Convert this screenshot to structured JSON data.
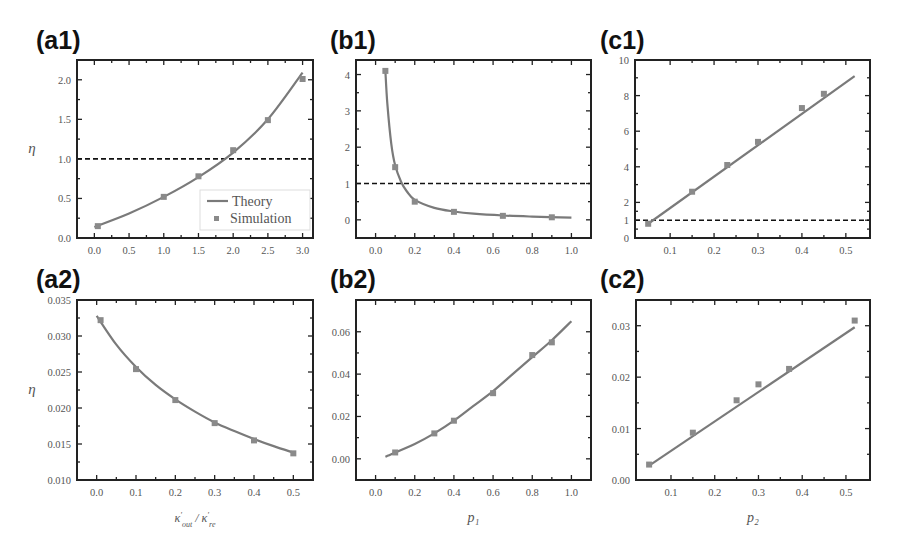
{
  "panels": [
    {
      "id": "a1",
      "label": "(a1)",
      "ylabel": "η",
      "xlabel": ""
    },
    {
      "id": "b1",
      "label": "(b1)",
      "ylabel": "",
      "xlabel": ""
    },
    {
      "id": "c1",
      "label": "(c1)",
      "ylabel": "",
      "xlabel": ""
    },
    {
      "id": "a2",
      "label": "(a2)",
      "ylabel": "η",
      "xlabel": "κ'_{out} / κ'_{re}"
    },
    {
      "id": "b2",
      "label": "(b2)",
      "ylabel": "",
      "xlabel": "p₁"
    },
    {
      "id": "c2",
      "label": "(c2)",
      "ylabel": "",
      "xlabel": "p₂"
    }
  ],
  "legend": {
    "theory": "Theory",
    "simulation": "Simulation"
  },
  "colors": {
    "curve": "#7a7a7a",
    "marker": "#8a8a8a",
    "frame": "#222222",
    "dashed": "#111111"
  },
  "chart_data": [
    {
      "id": "a1",
      "type": "line",
      "title": "(a1)",
      "xlabel": "",
      "ylabel": "η",
      "xlim": [
        -0.25,
        3.15
      ],
      "ylim": [
        0.0,
        2.25
      ],
      "xticks": [
        "0.0",
        "0.5",
        "1.0",
        "1.5",
        "2.0",
        "2.5",
        "3.0"
      ],
      "yticks": [
        "0.0",
        "0.5",
        "1.0",
        "1.5",
        "2.0"
      ],
      "reference_line": {
        "y": 1.0,
        "style": "dashed"
      },
      "legend": [
        "Theory",
        "Simulation"
      ],
      "legend_position": "lower right",
      "series": [
        {
          "name": "Theory",
          "kind": "line",
          "x": [
            0.0,
            0.5,
            1.0,
            1.5,
            2.0,
            2.5,
            3.0
          ],
          "y": [
            0.14,
            0.31,
            0.52,
            0.77,
            1.08,
            1.5,
            2.09
          ]
        },
        {
          "name": "Simulation",
          "kind": "scatter",
          "x": [
            0.05,
            1.0,
            1.5,
            2.0,
            2.5,
            3.0
          ],
          "y": [
            0.15,
            0.52,
            0.78,
            1.11,
            1.49,
            2.01
          ]
        }
      ]
    },
    {
      "id": "b1",
      "type": "line",
      "title": "(b1)",
      "xlabel": "",
      "ylabel": "",
      "xlim": [
        -0.1,
        1.1
      ],
      "ylim": [
        -0.5,
        4.4
      ],
      "xticks": [
        "0.0",
        "0.2",
        "0.4",
        "0.6",
        "0.8",
        "1.0"
      ],
      "yticks": [
        "0",
        "1",
        "2",
        "3",
        "4"
      ],
      "reference_line": {
        "y": 1.0,
        "style": "dashed"
      },
      "series": [
        {
          "name": "Theory",
          "kind": "line",
          "x": [
            0.05,
            0.06,
            0.08,
            0.1,
            0.13,
            0.16,
            0.2,
            0.3,
            0.4,
            0.5,
            0.65,
            0.8,
            1.0
          ],
          "y": [
            4.1,
            3.2,
            2.1,
            1.5,
            1.05,
            0.78,
            0.55,
            0.33,
            0.23,
            0.17,
            0.12,
            0.09,
            0.06
          ]
        },
        {
          "name": "Simulation",
          "kind": "scatter",
          "x": [
            0.05,
            0.1,
            0.2,
            0.4,
            0.65,
            0.9
          ],
          "y": [
            4.1,
            1.45,
            0.5,
            0.22,
            0.11,
            0.07
          ]
        }
      ]
    },
    {
      "id": "c1",
      "type": "line",
      "title": "(c1)",
      "xlabel": "",
      "ylabel": "",
      "xlim": [
        0.02,
        0.555
      ],
      "ylim": [
        0,
        10
      ],
      "xticks": [
        "0.1",
        "0.2",
        "0.3",
        "0.4",
        "0.5"
      ],
      "yticks": [
        "0",
        "1",
        "2",
        "4",
        "6",
        "8",
        "10"
      ],
      "reference_line": {
        "y": 1.0,
        "style": "dashed"
      },
      "series": [
        {
          "name": "Theory",
          "kind": "line",
          "x": [
            0.05,
            0.52
          ],
          "y": [
            0.8,
            9.1
          ]
        },
        {
          "name": "Simulation",
          "kind": "scatter",
          "x": [
            0.05,
            0.15,
            0.23,
            0.3,
            0.4,
            0.45
          ],
          "y": [
            0.8,
            2.6,
            4.1,
            5.4,
            7.3,
            8.1
          ]
        }
      ]
    },
    {
      "id": "a2",
      "type": "line",
      "title": "(a2)",
      "xlabel": "κ'_{out} / κ'_{re}",
      "ylabel": "η",
      "xlim": [
        -0.05,
        0.55
      ],
      "ylim": [
        0.01,
        0.035
      ],
      "xticks": [
        "0.0",
        "0.1",
        "0.2",
        "0.3",
        "0.4",
        "0.5"
      ],
      "yticks": [
        "0.010",
        "0.015",
        "0.020",
        "0.025",
        "0.030",
        "0.035"
      ],
      "series": [
        {
          "name": "Theory",
          "kind": "line",
          "x": [
            0.0,
            0.05,
            0.1,
            0.15,
            0.2,
            0.25,
            0.3,
            0.35,
            0.4,
            0.45,
            0.5
          ],
          "y": [
            0.0328,
            0.0288,
            0.0257,
            0.0232,
            0.0212,
            0.0195,
            0.018,
            0.0168,
            0.0157,
            0.0147,
            0.0138
          ]
        },
        {
          "name": "Simulation",
          "kind": "scatter",
          "x": [
            0.01,
            0.1,
            0.2,
            0.3,
            0.4,
            0.5
          ],
          "y": [
            0.0322,
            0.0254,
            0.0211,
            0.0179,
            0.0155,
            0.0137
          ]
        }
      ]
    },
    {
      "id": "b2",
      "type": "line",
      "title": "(b2)",
      "xlabel": "p₁",
      "ylabel": "",
      "xlim": [
        -0.1,
        1.1
      ],
      "ylim": [
        -0.01,
        0.075
      ],
      "xticks": [
        "0.0",
        "0.2",
        "0.4",
        "0.6",
        "0.8",
        "1.0"
      ],
      "yticks": [
        "0.00",
        "0.02",
        "0.04",
        "0.06"
      ],
      "series": [
        {
          "name": "Theory",
          "kind": "line",
          "x": [
            0.05,
            0.2,
            0.3,
            0.4,
            0.5,
            0.6,
            0.7,
            0.8,
            0.9,
            1.0
          ],
          "y": [
            0.001,
            0.007,
            0.012,
            0.018,
            0.025,
            0.032,
            0.04,
            0.048,
            0.056,
            0.065
          ]
        },
        {
          "name": "Simulation",
          "kind": "scatter",
          "x": [
            0.1,
            0.3,
            0.4,
            0.6,
            0.8,
            0.9
          ],
          "y": [
            0.003,
            0.012,
            0.018,
            0.031,
            0.049,
            0.055
          ]
        }
      ]
    },
    {
      "id": "c2",
      "type": "line",
      "title": "(c2)",
      "xlabel": "p₂",
      "ylabel": "",
      "xlim": [
        0.02,
        0.555
      ],
      "ylim": [
        0.0,
        0.035
      ],
      "xticks": [
        "0.1",
        "0.2",
        "0.3",
        "0.4",
        "0.5"
      ],
      "yticks": [
        "0.00",
        "0.01",
        "0.02",
        "0.03"
      ],
      "series": [
        {
          "name": "Theory",
          "kind": "line",
          "x": [
            0.05,
            0.52
          ],
          "y": [
            0.0028,
            0.0297
          ]
        },
        {
          "name": "Simulation",
          "kind": "scatter",
          "x": [
            0.05,
            0.15,
            0.25,
            0.3,
            0.37,
            0.52
          ],
          "y": [
            0.003,
            0.0092,
            0.0155,
            0.0186,
            0.0216,
            0.031
          ]
        }
      ]
    }
  ]
}
